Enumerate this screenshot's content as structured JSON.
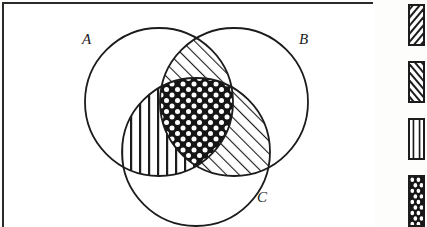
{
  "figure": {
    "type": "venn-diagram-3-set",
    "background_color": "#ffffff",
    "ink_color": "#1c1c1c",
    "frame": {
      "name": "figure-frame",
      "x": 2,
      "y": 2,
      "width": 371,
      "height": 228,
      "border_width": 2
    },
    "sets": [
      {
        "id": "A",
        "label": "A",
        "cx": 155,
        "cy": 98,
        "r": 74,
        "label_x": 78,
        "label_y": 40
      },
      {
        "id": "B",
        "label": "B",
        "cx": 230,
        "cy": 98,
        "r": 74,
        "label_x": 295,
        "label_y": 40
      },
      {
        "id": "C",
        "label": "C",
        "cx": 192,
        "cy": 148,
        "r": 74,
        "label_x": 253,
        "label_y": 198
      }
    ],
    "shaded_regions": [
      {
        "id": "A-inter-B-only",
        "name": "region-a-intersect-b",
        "sets": [
          "A",
          "B"
        ],
        "pattern": "diagonal-forward-hatch"
      },
      {
        "id": "A-inter-C-only",
        "name": "region-a-intersect-c",
        "sets": [
          "A",
          "C"
        ],
        "pattern": "vertical-lines"
      },
      {
        "id": "B-inter-C-only",
        "name": "region-b-intersect-c",
        "sets": [
          "B",
          "C"
        ],
        "pattern": "diagonal-forward-hatch"
      },
      {
        "id": "A-inter-B-inter-C",
        "name": "region-triple-intersection",
        "sets": [
          "A",
          "B",
          "C"
        ],
        "pattern": "dark-dots"
      }
    ],
    "unshaded_regions": [
      {
        "id": "A-only",
        "name": "region-a-only",
        "pattern": "none"
      },
      {
        "id": "B-only",
        "name": "region-b-only",
        "pattern": "none"
      },
      {
        "id": "C-only",
        "name": "region-c-only",
        "pattern": "none"
      }
    ]
  },
  "legend": {
    "name": "pattern-legend",
    "swatches": [
      {
        "id": "swatch-forward-hatch",
        "pattern": "diagonal-forward-hatch",
        "icon_name": "diagonal-forward-hatch-swatch-icon"
      },
      {
        "id": "swatch-backward-hatch",
        "pattern": "diagonal-backward-hatch",
        "icon_name": "diagonal-backward-hatch-swatch-icon"
      },
      {
        "id": "swatch-vertical-lines",
        "pattern": "vertical-lines",
        "icon_name": "vertical-lines-swatch-icon"
      },
      {
        "id": "swatch-dark-dots",
        "pattern": "dark-dots",
        "icon_name": "dark-dots-swatch-icon"
      }
    ]
  }
}
